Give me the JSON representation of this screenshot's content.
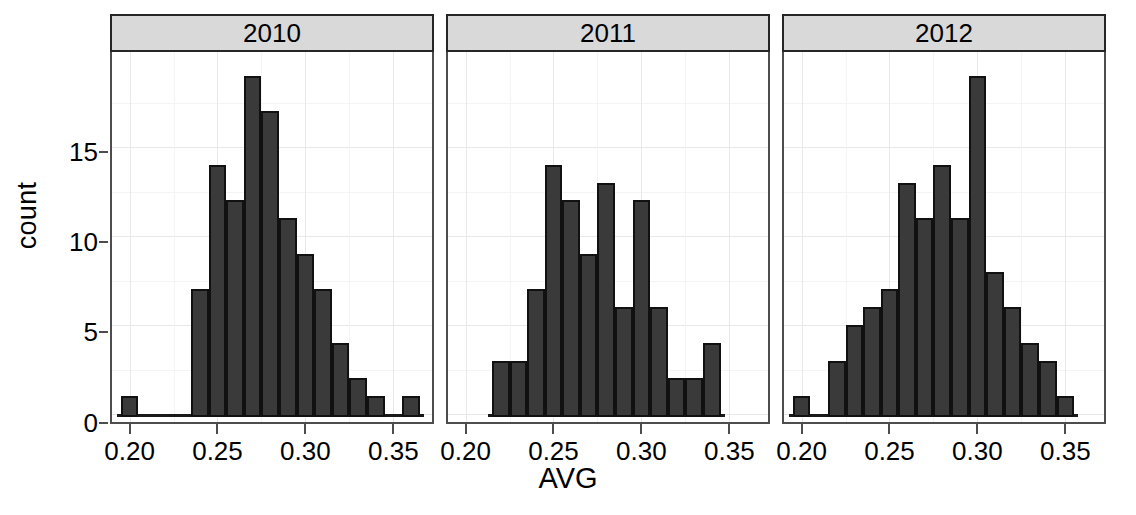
{
  "chart_data": {
    "type": "bar",
    "chart_kind": "faceted-histogram",
    "title": "",
    "subtitle": "",
    "xlabel": "AVG",
    "ylabel": "count",
    "grid": true,
    "legend": "none",
    "xlim": [
      0.19,
      0.372
    ],
    "ylim": [
      0,
      20
    ],
    "y_ticks": [
      0,
      5,
      10,
      15
    ],
    "y_tick_labels": [
      "0",
      "5",
      "10",
      "15"
    ],
    "x_ticks": [
      0.2,
      0.25,
      0.3,
      0.35
    ],
    "x_tick_labels": [
      "0.20",
      "0.25",
      "0.30",
      "0.35"
    ],
    "bin_width": 0.01,
    "facet_variable": "year",
    "panels": [
      {
        "label": "2010",
        "bin_starts": [
          0.195,
          0.205,
          0.215,
          0.225,
          0.235,
          0.245,
          0.255,
          0.265,
          0.275,
          0.285,
          0.295,
          0.305,
          0.315,
          0.325,
          0.335,
          0.345,
          0.355
        ],
        "values": [
          1,
          0,
          0,
          0,
          7,
          14,
          12,
          19,
          17,
          11,
          9,
          7,
          4,
          2,
          1,
          0,
          1
        ]
      },
      {
        "label": "2011",
        "bin_starts": [
          0.215,
          0.225,
          0.235,
          0.245,
          0.255,
          0.265,
          0.275,
          0.285,
          0.295,
          0.305,
          0.315,
          0.325,
          0.335
        ],
        "values": [
          3,
          3,
          7,
          14,
          12,
          9,
          13,
          6,
          12,
          6,
          2,
          2,
          4
        ]
      },
      {
        "label": "2012",
        "bin_starts": [
          0.195,
          0.205,
          0.215,
          0.225,
          0.235,
          0.245,
          0.255,
          0.265,
          0.275,
          0.285,
          0.295,
          0.305,
          0.315,
          0.325,
          0.335
        ],
        "values": [
          1,
          0,
          3,
          5,
          6,
          7,
          13,
          11,
          14,
          11,
          19,
          8,
          6,
          4,
          3,
          1
        ]
      }
    ],
    "colors": {
      "bar_fill": "#3a3a3a",
      "bar_border": "#111111",
      "strip_background": "#d9d9d9",
      "panel_border": "#4d4d4d",
      "gridline": "#e8e8e8",
      "background": "#ffffff",
      "text": "#000000"
    }
  },
  "axes": {
    "y_title": "count",
    "x_title": "AVG",
    "y_tick_labels": [
      "15",
      "10",
      "5",
      "0"
    ],
    "x_tick_labels": [
      "0.20",
      "0.25",
      "0.30",
      "0.35"
    ]
  },
  "panels": {
    "p0_label": "2010",
    "p1_label": "2011",
    "p2_label": "2012"
  }
}
